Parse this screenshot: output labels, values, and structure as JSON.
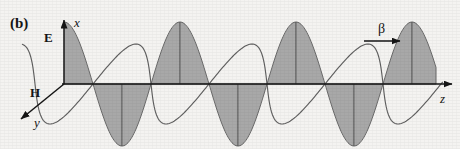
{
  "figure": {
    "panel_label": "(b)",
    "background_color": "#f4f3f1",
    "ink_color": "#151515",
    "wave_fill_color": "#a8a8a8",
    "wave_stroke_color": "#5f5f5f"
  },
  "axes": {
    "origin": {
      "x": 64,
      "y": 84
    },
    "vertical": {
      "name": "x",
      "label": "x",
      "label_pos": {
        "x": 74,
        "y": 16
      },
      "tip": {
        "x": 64,
        "y": 20
      }
    },
    "horizontal": {
      "name": "z",
      "label": "z",
      "label_pos": {
        "x": 440,
        "y": 92
      },
      "tip": {
        "x": 452,
        "y": 84
      }
    },
    "depth": {
      "name": "y",
      "label": "y",
      "label_pos": {
        "x": 34,
        "y": 116
      },
      "tip": {
        "x": 21,
        "y": 119
      }
    }
  },
  "field_labels": [
    {
      "name": "E",
      "label": "E",
      "x": 44,
      "y": 31
    },
    {
      "name": "H",
      "label": "H",
      "x": 30,
      "y": 86
    }
  ],
  "propagation": {
    "label": "β",
    "label_pos": {
      "x": 378,
      "y": 22
    },
    "arrow": {
      "x1": 364,
      "y1": 41,
      "x2": 400,
      "y2": 41
    }
  },
  "chart_data": {
    "type": "line",
    "title": "",
    "xlabel": "z",
    "ylabel": "x",
    "grid": false,
    "legend": "none",
    "axis_origin_px": {
      "x": 64,
      "y": 84
    },
    "period_px": 116,
    "series": [
      {
        "name": "E",
        "plane": "x-z",
        "phase": "cosine",
        "amplitude_px": 62,
        "filled": true,
        "fill_color": "#a8a8a8"
      },
      {
        "name": "H",
        "plane": "y-z",
        "phase": "cosine",
        "amplitude_px_horizontal": 14,
        "amplitude_px_vertical": 40,
        "filled": false
      }
    ],
    "zero_crossings_px": [
      122,
      180,
      238,
      296,
      354,
      412
    ],
    "peaks_px": [
      64,
      180,
      296,
      412
    ],
    "troughs_px": [
      122,
      238,
      354
    ]
  }
}
